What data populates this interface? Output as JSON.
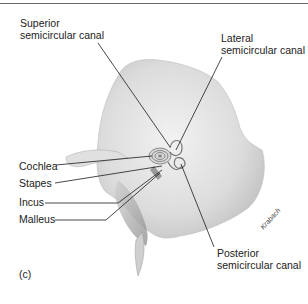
{
  "figure": {
    "panel_label": "(c)",
    "artist_signature": "Krabach",
    "labels": {
      "superior_line1": "Superior",
      "superior_line2": "semicircular canal",
      "lateral_line1": "Lateral",
      "lateral_line2": "semicircular canal",
      "cochlea": "Cochlea",
      "stapes": "Stapes",
      "incus": "Incus",
      "malleus": "Malleus",
      "posterior_line1": "Posterior",
      "posterior_line2": "semicircular canal"
    }
  }
}
